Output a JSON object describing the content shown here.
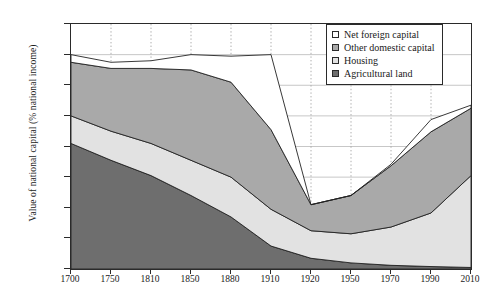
{
  "axes": {
    "y_title": "Value of national capital (% national income)",
    "y_ticks": [
      "800%",
      "700%",
      "600%",
      "500%",
      "400%",
      "300%",
      "200%",
      "100%",
      "0%"
    ],
    "x_ticks": [
      "1700",
      "1750",
      "1810",
      "1850",
      "1880",
      "1910",
      "1920",
      "1950",
      "1970",
      "1990",
      "2010"
    ]
  },
  "legend": {
    "items": [
      {
        "label": "Net foreign capital",
        "color": "#ffffff",
        "name": "net-foreign-capital"
      },
      {
        "label": "Other domestic capital",
        "color": "#a9a9a9",
        "name": "other-domestic-capital"
      },
      {
        "label": "Housing",
        "color": "#e2e2e2",
        "name": "housing"
      },
      {
        "label": "Agricultural land",
        "color": "#6e6e6e",
        "name": "agricultural-land"
      }
    ]
  },
  "chart_data": {
    "type": "area",
    "title": "",
    "xlabel": "",
    "ylabel": "Value of national capital (% national income)",
    "ylim": [
      0,
      800
    ],
    "ytick_values": [
      800,
      700,
      600,
      500,
      400,
      300,
      200,
      100,
      0
    ],
    "grid": true,
    "legend_position": "top-right",
    "stacked": true,
    "categories": [
      "1700",
      "1750",
      "1810",
      "1850",
      "1880",
      "1910",
      "1920",
      "1950",
      "1970",
      "1990",
      "2010"
    ],
    "series": [
      {
        "name": "Agricultural land",
        "color": "#6e6e6e",
        "values": [
          410,
          355,
          305,
          240,
          170,
          75,
          35,
          20,
          12,
          8,
          5
        ]
      },
      {
        "name": "Housing",
        "color": "#e2e2e2",
        "values": [
          90,
          95,
          105,
          115,
          130,
          120,
          90,
          95,
          125,
          175,
          300
        ]
      },
      {
        "name": "Other domestic capital",
        "color": "#a9a9a9",
        "values": [
          175,
          205,
          245,
          295,
          310,
          260,
          85,
          125,
          200,
          265,
          220
        ]
      },
      {
        "name": "Net foreign capital",
        "color": "#ffffff",
        "values": [
          25,
          20,
          25,
          50,
          85,
          245,
          0,
          0,
          5,
          40,
          10
        ]
      }
    ],
    "totals": [
      700,
      675,
      680,
      700,
      695,
      700,
      210,
      240,
      342,
      488,
      535
    ]
  }
}
